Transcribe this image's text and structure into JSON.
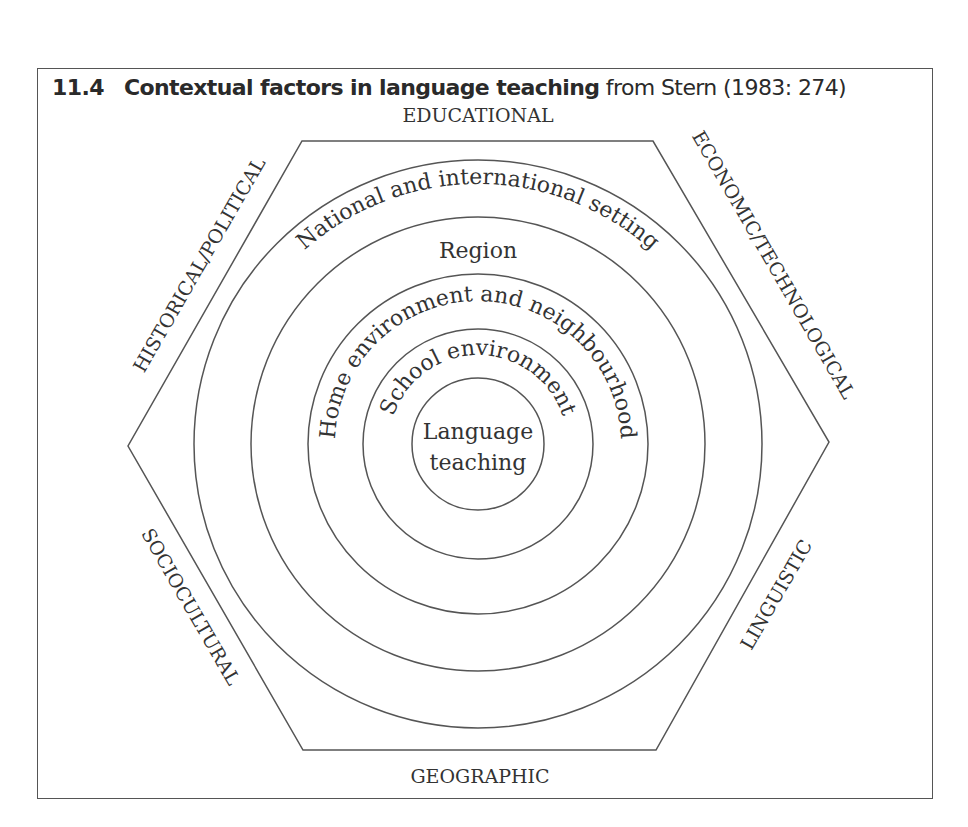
{
  "figure": {
    "number": "11.4",
    "title_bold": "Contextual factors in language teaching",
    "title_source": "from Stern (1983: 274)"
  },
  "hexagon_sides": {
    "top": "EDUCATIONAL",
    "top_right": "ECONOMIC/TECHNOLOGICAL",
    "bottom_right": "LINGUISTIC",
    "bottom": "GEOGRAPHIC",
    "bottom_left": "SOCIOCULTURAL",
    "top_left": "HISTORICAL/POLITICAL"
  },
  "rings": [
    {
      "label": "National and international setting"
    },
    {
      "label": "Region"
    },
    {
      "label": "Home environment and neighbourhood"
    },
    {
      "label": "School environment"
    }
  ],
  "core": {
    "line1": "Language",
    "line2": "teaching"
  },
  "colors": {
    "line": "#555555",
    "text": "#333333",
    "background": "#ffffff"
  }
}
